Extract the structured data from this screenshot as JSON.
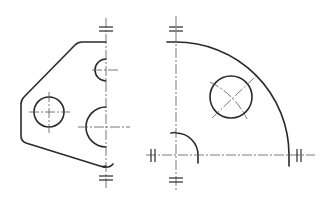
{
  "drawing": {
    "type": "technical-drawing",
    "views": [
      {
        "name": "left-view",
        "description": "half plate with holes and half-circle cutouts"
      },
      {
        "name": "right-view",
        "description": "quarter circle plate with hole"
      }
    ],
    "colors": {
      "line": "#2a2a2a",
      "centerline": "#555555",
      "background": "#ffffff"
    }
  }
}
